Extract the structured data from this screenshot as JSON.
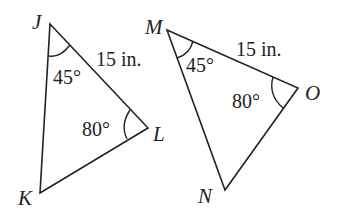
{
  "figure": {
    "triangles": [
      {
        "name": "JKL",
        "vertices": {
          "J": "J",
          "K": "K",
          "L": "L"
        },
        "side_label": "15 in.",
        "angle_J": "45°",
        "angle_L": "80°"
      },
      {
        "name": "MNO",
        "vertices": {
          "M": "M",
          "N": "N",
          "O": "O"
        },
        "side_label": "15 in.",
        "angle_M": "45°",
        "angle_O": "80°"
      }
    ]
  }
}
